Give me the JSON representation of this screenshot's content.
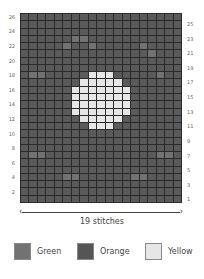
{
  "chart": {
    "title": "",
    "stitch_count_label": "19 stitches",
    "columns": 19,
    "rows": 26,
    "left_row_labels": [
      "26",
      "24",
      "22",
      "20",
      "18",
      "16",
      "14",
      "12",
      "10",
      "8",
      "6",
      "4",
      "2"
    ],
    "right_row_labels": [
      "25",
      "23",
      "21",
      "19",
      "17",
      "15",
      "13",
      "11",
      "9",
      "7",
      "5",
      "3",
      "1"
    ],
    "grid_rows_top_to_bottom": [
      "OOOOOOOOOOOOOOOOOOO",
      "OOOOOOOOOOOOOOOOOOO",
      "OOOOOOOOOOOOOOOOOOO",
      "OOOOOOGGOOOOOOOOOOO",
      "OOOOOGOOGOOOOOGOOOO",
      "OOOOOOOOOOOOOOOGOOO",
      "OOOOOOOOOOOOOOOOOOO",
      "OOOOOOOOOOOOOOOOOOO",
      "OGGOOOOOYYYOOOOOGOO",
      "OOOOOOOYYYYYOOOOOOO",
      "OOOOOOYYYYYYYOOOOOO",
      "OOOOOOYYYYYYYOOOOOO",
      "OOOOOOYYYYYYYOOOOOO",
      "OOOOOOYYYYYYYOOOOOO",
      "OOOOOOOYYYYYOOOOOOO",
      "OOOOOOOOYYYOOOOOOOO",
      "OOOOOOOOOOOOOOOOOOO",
      "OOOOOOOOOOOOOOOOOOO",
      "OOOOOOOOOOOOOOOOOOO",
      "OGGOOOOOOOOOOOOOGGO",
      "OOOOOOOOOOOOOOOOOOO",
      "OOOOOOOOOOOOOOOOOOO",
      "OOOOOGGOOOOOOGGOOOO",
      "OOOOOOOOOOOOOOOOOOO",
      "OOOOOOOOOOOOOOOOOOO",
      "OOOOOOOOOOOOOOOOOOO"
    ]
  },
  "legend": [
    {
      "label": "Green",
      "color": "#727272"
    },
    {
      "label": "Orange",
      "color": "#555555"
    },
    {
      "label": "Yellow",
      "color": "#e6e6e6"
    }
  ],
  "arrow": {
    "left": "‹",
    "right": "›"
  }
}
